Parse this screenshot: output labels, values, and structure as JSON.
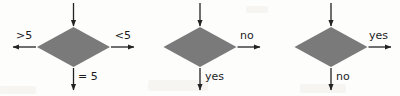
{
  "figure": {
    "background_color": "#fdfdfc",
    "diamond_fill": "#7a7a7a",
    "arrow_color": "#222222",
    "text_color": "#1c1c1c"
  },
  "diagram_data": {
    "type": "diagram",
    "description": "Three flowchart decision diamonds with labeled outgoing arrows",
    "nodes": [
      {
        "id": "decision-1",
        "shape": "diamond",
        "fill": "#7a7a7a",
        "label": "",
        "inputs": [
          {
            "direction": "top",
            "label": ""
          }
        ],
        "outputs": [
          {
            "direction": "left",
            "label": ">5"
          },
          {
            "direction": "right",
            "label": "<5"
          },
          {
            "direction": "bottom",
            "label": "= 5"
          }
        ]
      },
      {
        "id": "decision-2",
        "shape": "diamond",
        "fill": "#7a7a7a",
        "label": "",
        "inputs": [
          {
            "direction": "top",
            "label": ""
          }
        ],
        "outputs": [
          {
            "direction": "right",
            "label": "no"
          },
          {
            "direction": "bottom",
            "label": "yes"
          }
        ]
      },
      {
        "id": "decision-3",
        "shape": "diamond",
        "fill": "#7a7a7a",
        "label": "",
        "inputs": [
          {
            "direction": "top",
            "label": ""
          }
        ],
        "outputs": [
          {
            "direction": "right",
            "label": "yes"
          },
          {
            "direction": "bottom",
            "label": "no"
          }
        ]
      }
    ]
  },
  "labels": {
    "d1_left": ">5",
    "d1_right": "<5",
    "d1_bottom": "= 5",
    "d2_right": "no",
    "d2_bottom": "yes",
    "d3_right": "yes",
    "d3_bottom": "no"
  }
}
